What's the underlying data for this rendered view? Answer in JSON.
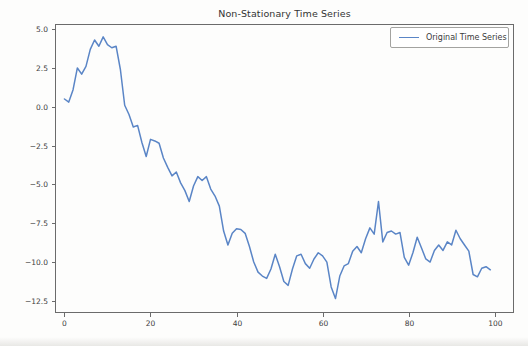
{
  "figure": {
    "background": "#fdfdfc"
  },
  "chart_data": {
    "type": "line",
    "title": "Non-Stationary Time Series",
    "xlabel": "",
    "ylabel": "",
    "grid": false,
    "legend_position": "upper right",
    "legend": [
      {
        "label": "Original Time Series",
        "color": "#5a85c6"
      }
    ],
    "x_ticks": [
      0,
      20,
      40,
      60,
      80,
      100
    ],
    "y_ticks": [
      5.0,
      2.5,
      0.0,
      -2.5,
      -5.0,
      -7.5,
      -10.0,
      -12.5
    ],
    "xlim": [
      -2.2,
      104.5
    ],
    "ylim": [
      -13.28,
      5.33
    ],
    "x": {
      "start": 0,
      "step": 1,
      "count": 100
    },
    "series": [
      {
        "name": "Original Time Series",
        "values": [
          0.5,
          0.3,
          1.1,
          2.5,
          2.1,
          2.6,
          3.7,
          4.3,
          3.9,
          4.5,
          4.0,
          3.8,
          3.9,
          2.4,
          0.1,
          -0.5,
          -1.3,
          -1.2,
          -2.3,
          -3.2,
          -2.1,
          -2.2,
          -2.35,
          -3.3,
          -3.9,
          -4.45,
          -4.2,
          -4.9,
          -5.4,
          -6.1,
          -5.1,
          -4.5,
          -4.75,
          -4.5,
          -5.3,
          -5.75,
          -6.4,
          -8.0,
          -8.9,
          -8.15,
          -7.85,
          -7.9,
          -8.15,
          -9.0,
          -10.0,
          -10.65,
          -10.9,
          -11.05,
          -10.45,
          -9.5,
          -10.3,
          -11.25,
          -11.5,
          -10.45,
          -9.6,
          -9.5,
          -10.1,
          -10.4,
          -9.8,
          -9.4,
          -9.6,
          -10.0,
          -11.6,
          -12.35,
          -10.9,
          -10.25,
          -10.1,
          -9.3,
          -9.0,
          -9.4,
          -8.5,
          -7.8,
          -8.2,
          -6.1,
          -8.7,
          -8.1,
          -8.0,
          -8.2,
          -8.1,
          -9.7,
          -10.2,
          -9.4,
          -8.4,
          -9.1,
          -9.8,
          -10.0,
          -9.25,
          -8.9,
          -9.25,
          -8.7,
          -8.9,
          -7.95,
          -8.5,
          -8.9,
          -9.3,
          -10.8,
          -10.95,
          -10.4,
          -10.3,
          -10.5
        ]
      }
    ],
    "colors": {
      "line": "#5a85c6",
      "axis": "#6b6b6b",
      "tick_text": "#3c3c3c",
      "legend_border": "#a3a3a0"
    },
    "axes_px": {
      "left": 55,
      "top": 24,
      "width": 459,
      "height": 289
    }
  }
}
